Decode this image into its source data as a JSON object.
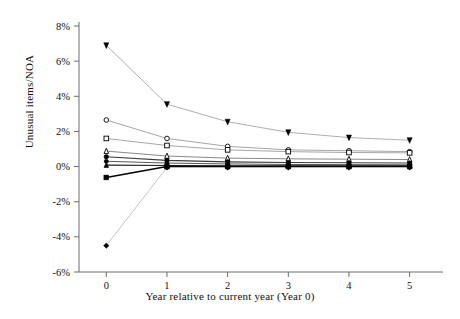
{
  "chart_data": {
    "type": "line",
    "title": "",
    "subtitle": "",
    "xlabel": "Year relative to current year (Year 0)",
    "ylabel": "Unusual items/NOA",
    "x": [
      0,
      1,
      2,
      3,
      4,
      5
    ],
    "xticklabels": [
      "0",
      "1",
      "2",
      "3",
      "4",
      "5"
    ],
    "xlim": [
      -0.45,
      5.55
    ],
    "ylim": [
      -6,
      8
    ],
    "yticks": [
      -6,
      -4,
      -2,
      0,
      2,
      4,
      6,
      8
    ],
    "yticklabels": [
      "-6%",
      "-4%",
      "-2%",
      "0%",
      "2%",
      "4%",
      "6%",
      "8%"
    ],
    "grid": false,
    "legend": "none",
    "units": "percent",
    "series": [
      {
        "name": "series-1",
        "marker": "filled-triangle-down",
        "color": "#000000",
        "line_color": "#9a9a9a",
        "line_width": 0.8,
        "marker_size": 5,
        "values": [
          6.9,
          3.55,
          2.55,
          1.95,
          1.65,
          1.5
        ]
      },
      {
        "name": "series-2",
        "marker": "open-circle",
        "color": "#000000",
        "line_color": "#8f8f8f",
        "line_width": 0.8,
        "marker_size": 4.6,
        "values": [
          2.65,
          1.6,
          1.15,
          0.95,
          0.9,
          0.85
        ]
      },
      {
        "name": "series-3",
        "marker": "open-square",
        "color": "#000000",
        "line_color": "#8f8f8f",
        "line_width": 0.8,
        "marker_size": 4.6,
        "values": [
          1.6,
          1.2,
          0.95,
          0.85,
          0.8,
          0.78
        ]
      },
      {
        "name": "series-4",
        "marker": "open-triangle-up",
        "color": "#000000",
        "line_color": "#7a7a7a",
        "line_width": 0.9,
        "marker_size": 4.6,
        "values": [
          0.88,
          0.6,
          0.48,
          0.44,
          0.42,
          0.4
        ]
      },
      {
        "name": "series-5",
        "marker": "filled-circle",
        "color": "#000000",
        "line_color": "#3c3c3c",
        "line_width": 1.1,
        "marker_size": 4.6,
        "values": [
          0.56,
          0.35,
          0.27,
          0.23,
          0.22,
          0.2
        ]
      },
      {
        "name": "series-6",
        "marker": "filled-circle",
        "color": "#000000",
        "line_color": "#565656",
        "line_width": 1.0,
        "marker_size": 4.2,
        "values": [
          0.3,
          0.2,
          0.15,
          0.12,
          0.11,
          0.1
        ]
      },
      {
        "name": "series-7",
        "marker": "filled-triangle-up",
        "color": "#000000",
        "line_color": "#1e1e1e",
        "line_width": 1.1,
        "marker_size": 4.6,
        "values": [
          0.08,
          0.06,
          0.05,
          0.05,
          0.05,
          0.05
        ]
      },
      {
        "name": "series-8",
        "marker": "filled-square",
        "color": "#000000",
        "line_color": "#000000",
        "line_width": 1.5,
        "marker_size": 4.8,
        "values": [
          -0.62,
          0.0,
          0.0,
          0.0,
          0.0,
          0.0
        ]
      },
      {
        "name": "series-9",
        "marker": "filled-diamond",
        "color": "#000000",
        "line_color": "#b6b6b6",
        "line_width": 0.8,
        "marker_size": 4.6,
        "values": [
          -4.5,
          -0.05,
          -0.05,
          -0.05,
          -0.05,
          -0.05
        ]
      }
    ]
  },
  "axes": {
    "y_axis_name": "Unusual items/NOA",
    "x_axis_name": "Year relative to current year (Year 0)"
  }
}
